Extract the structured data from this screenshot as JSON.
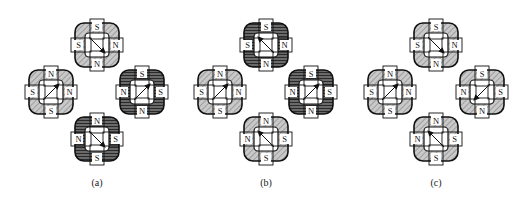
{
  "figure": {
    "panels": [
      {
        "id": "a",
        "caption": "(a)",
        "caption_pos": [
          97,
          183
        ],
        "cells": [
          {
            "position": "top",
            "center": [
              97,
              45
            ],
            "fill": "hatched",
            "arrow": "down-right",
            "poles": {
              "top": "S",
              "left": "S",
              "right": "N",
              "bottom": "N"
            }
          },
          {
            "position": "left",
            "center": [
              51,
              92
            ],
            "fill": "hatched",
            "arrow": "up-right",
            "poles": {
              "top": "N",
              "left": "S",
              "right": "N",
              "bottom": "S"
            }
          },
          {
            "position": "right",
            "center": [
              142,
              92
            ],
            "fill": "dark",
            "arrow": "up-right",
            "poles": {
              "top": "S",
              "left": "N",
              "right": "S",
              "bottom": "N"
            }
          },
          {
            "position": "bottom",
            "center": [
              97,
              139
            ],
            "fill": "dark",
            "arrow": "down-right",
            "poles": {
              "top": "N",
              "left": "N",
              "right": "S",
              "bottom": "S"
            }
          }
        ]
      },
      {
        "id": "b",
        "caption": "(b)",
        "caption_pos": [
          266,
          183
        ],
        "cells": [
          {
            "position": "top",
            "center": [
              266,
              45
            ],
            "fill": "dark",
            "arrow": "up-left",
            "poles": {
              "top": "S",
              "left": "S",
              "right": "N",
              "bottom": "N"
            }
          },
          {
            "position": "left",
            "center": [
              220,
              92
            ],
            "fill": "hatched",
            "arrow": "up-right",
            "poles": {
              "top": "N",
              "left": "S",
              "right": "N",
              "bottom": "S"
            }
          },
          {
            "position": "right",
            "center": [
              311,
              92
            ],
            "fill": "dark",
            "arrow": "up-right",
            "poles": {
              "top": "S",
              "left": "N",
              "right": "S",
              "bottom": "N"
            }
          },
          {
            "position": "bottom",
            "center": [
              266,
              139
            ],
            "fill": "hatched",
            "arrow": "up-left",
            "poles": {
              "top": "N",
              "left": "N",
              "right": "S",
              "bottom": "S"
            }
          }
        ]
      },
      {
        "id": "c",
        "caption": "(c)",
        "caption_pos": [
          436,
          183
        ],
        "cells": [
          {
            "position": "top",
            "center": [
              436,
              45
            ],
            "fill": "hatched",
            "arrow": "down-right",
            "poles": {
              "top": "S",
              "left": "S",
              "right": "N",
              "bottom": "N"
            }
          },
          {
            "position": "left",
            "center": [
              390,
              92
            ],
            "fill": "hatched",
            "arrow": "up-right",
            "poles": {
              "top": "N",
              "left": "S",
              "right": "N",
              "bottom": "S"
            }
          },
          {
            "position": "right",
            "center": [
              482,
              92
            ],
            "fill": "hatched",
            "arrow": "down-left",
            "poles": {
              "top": "S",
              "left": "N",
              "right": "S",
              "bottom": "N"
            }
          },
          {
            "position": "bottom",
            "center": [
              436,
              139
            ],
            "fill": "hatched",
            "arrow": "up-left",
            "poles": {
              "top": "N",
              "left": "N",
              "right": "S",
              "bottom": "S"
            }
          }
        ]
      }
    ]
  },
  "colors": {
    "hatched_base": "#c9c9c9",
    "hatched_line": "#8a8a8a",
    "dark_base": "#5a5a5a",
    "dark_line": "#2a2a2a",
    "stroke": "#111111",
    "background": "#ffffff"
  }
}
